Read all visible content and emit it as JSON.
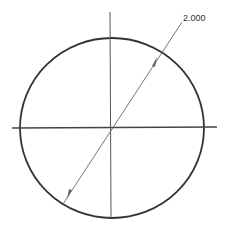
{
  "drawing": {
    "type": "circle-with-diameter-dimension",
    "colors": {
      "outline": "#333333",
      "centerline": "#444444",
      "dimension": "#666666",
      "text": "#333333"
    },
    "circle": {
      "cx": 112,
      "cy": 128,
      "rx": 92,
      "ry": 90
    },
    "centerlines": {
      "horizontal": {
        "x1": 12,
        "y1": 128,
        "x2": 217,
        "y2": 127
      },
      "vertical": {
        "x1": 110,
        "y1": 12,
        "x2": 111,
        "y2": 218
      }
    },
    "dimension": {
      "label": "2.000",
      "diameter_line": {
        "x1": 63,
        "y1": 204,
        "x2": 182,
        "y2": 22
      },
      "text_pos": {
        "x": 183,
        "y": 20
      }
    }
  }
}
